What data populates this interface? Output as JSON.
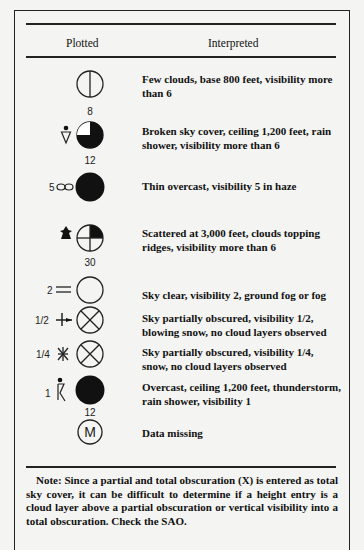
{
  "header": {
    "col_plotted": "Plotted",
    "col_interpreted": "Interpreted"
  },
  "rows": [
    {
      "sky_cover": "few-clouds",
      "left_label": "",
      "weather_symbol": "",
      "below_label": "8",
      "interpreted": "Few clouds, base 800 feet, visibility more than 6"
    },
    {
      "sky_cover": "broken",
      "left_label": "",
      "weather_symbol": "rain-shower",
      "below_label": "12",
      "interpreted": "Broken sky cover, ceiling 1,200 feet, rain shower, visibility more than 6"
    },
    {
      "sky_cover": "overcast",
      "left_label": "5",
      "weather_symbol": "haze",
      "below_label": "",
      "interpreted": "Thin overcast, visibility 5 in haze"
    },
    {
      "sky_cover": "scattered",
      "left_label": "",
      "weather_symbol": "clouds-topping-ridges",
      "below_label": "30",
      "interpreted": "Scattered at 3,000 feet, clouds topping ridges, visibility more than 6"
    },
    {
      "sky_cover": "clear",
      "left_label": "2",
      "weather_symbol": "fog",
      "below_label": "",
      "interpreted": "Sky clear, visibility 2, ground fog or fog"
    },
    {
      "sky_cover": "obscured",
      "left_label": "1/2",
      "weather_symbol": "blowing-snow",
      "below_label": "",
      "interpreted": "Sky partially obscured, visibility 1/2, blowing snow, no cloud layers observed"
    },
    {
      "sky_cover": "obscured",
      "left_label": "1/4",
      "weather_symbol": "snow",
      "below_label": "",
      "interpreted": "Sky partially obscured, visibility 1/4, snow, no cloud layers observed"
    },
    {
      "sky_cover": "overcast",
      "left_label": "1",
      "weather_symbol": "thunderstorm-rain-shower",
      "below_label": "12",
      "interpreted": "Overcast, ceiling 1,200 feet, thunderstorm, rain shower, visibility 1"
    },
    {
      "sky_cover": "missing",
      "left_label": "",
      "weather_symbol": "",
      "below_label": "",
      "center_label": "M",
      "interpreted": "Data missing"
    }
  ],
  "note": "Note: Since a partial and total obscuration (X) is entered as total sky cover, it can be difficult to determine if a height entry is a cloud layer above a partial obscuration or vertical visibility into a total obscuration. Check the SAO."
}
